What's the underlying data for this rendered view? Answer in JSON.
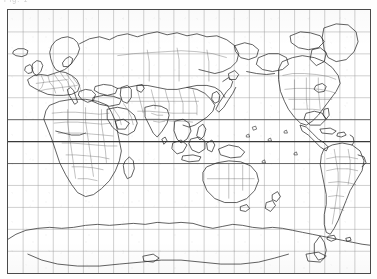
{
  "header": {
    "caption_text": "Fig. 1",
    "caption_note": "clipped faded header line"
  },
  "map": {
    "title": "World Map",
    "projection_label": "Equirectangular (Plate Carrée)",
    "centered_on": "Pacific / 150°E",
    "style": "black outline line map, photocopied",
    "frame_color": "#4a4a4a",
    "coastline_color": "#2b2b2b",
    "border_color": "#555555",
    "graticule_color": "#9a9a9a",
    "equator_color": "#3a3a3a",
    "background_color": "#ffffff",
    "graticule": {
      "longitude_step_deg": 15,
      "latitude_step_deg": 15,
      "lon_min_deg": -30,
      "lon_max_deg": 330,
      "lat_min_deg": -90,
      "lat_max_deg": 90,
      "columns": 24,
      "rows": 12,
      "emphasized_latitudes": [
        0,
        30,
        -30
      ],
      "grid_on": true
    },
    "features": [
      {
        "name": "Europe"
      },
      {
        "name": "Africa"
      },
      {
        "name": "Asia"
      },
      {
        "name": "Russia"
      },
      {
        "name": "India"
      },
      {
        "name": "China"
      },
      {
        "name": "Japan"
      },
      {
        "name": "Southeast Asia"
      },
      {
        "name": "Indonesia"
      },
      {
        "name": "Australia"
      },
      {
        "name": "New Zealand"
      },
      {
        "name": "Greenland"
      },
      {
        "name": "North America"
      },
      {
        "name": "Central America"
      },
      {
        "name": "Caribbean"
      },
      {
        "name": "South America"
      },
      {
        "name": "Antarctica"
      },
      {
        "name": "Iceland"
      },
      {
        "name": "British Isles"
      },
      {
        "name": "Madagascar"
      }
    ]
  }
}
